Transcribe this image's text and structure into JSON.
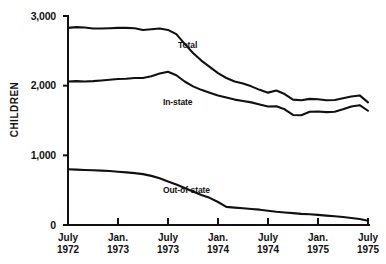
{
  "chart_data": {
    "type": "line",
    "title": "",
    "xlabel": "",
    "ylabel": "CHILDREN",
    "ylim": [
      0,
      3000
    ],
    "yticks": [
      0,
      1000,
      2000,
      3000
    ],
    "ytick_labels": [
      "0",
      "1,000",
      "2,000",
      "3,000"
    ],
    "grid": false,
    "legend_position": "inline-annotations",
    "x_tick_labels": [
      {
        "month": "July",
        "year": "1972"
      },
      {
        "month": "Jan.",
        "year": "1973"
      },
      {
        "month": "July",
        "year": "1973"
      },
      {
        "month": "Jan.",
        "year": "1974"
      },
      {
        "month": "July",
        "year": "1974"
      },
      {
        "month": "Jan.",
        "year": "1975"
      },
      {
        "month": "July",
        "year": "1975"
      }
    ],
    "x": [
      "1972-07",
      "1972-08",
      "1972-09",
      "1972-10",
      "1972-11",
      "1972-12",
      "1973-01",
      "1973-02",
      "1973-03",
      "1973-04",
      "1973-05",
      "1973-06",
      "1973-07",
      "1973-08",
      "1973-09",
      "1973-10",
      "1973-11",
      "1973-12",
      "1974-01",
      "1974-02",
      "1974-03",
      "1974-04",
      "1974-05",
      "1974-06",
      "1974-07",
      "1974-08",
      "1974-09",
      "1974-10",
      "1974-11",
      "1974-12",
      "1975-01",
      "1975-02",
      "1975-03",
      "1975-04",
      "1975-05",
      "1975-06",
      "1975-07"
    ],
    "series": [
      {
        "name": "Total",
        "label": "Total",
        "values": [
          2830,
          2840,
          2835,
          2820,
          2820,
          2825,
          2830,
          2830,
          2825,
          2800,
          2810,
          2820,
          2800,
          2740,
          2600,
          2470,
          2360,
          2270,
          2180,
          2110,
          2060,
          2030,
          1990,
          1940,
          1900,
          1930,
          1880,
          1800,
          1790,
          1810,
          1805,
          1790,
          1795,
          1820,
          1845,
          1860,
          1760
        ]
      },
      {
        "name": "In-state",
        "label": "In-state",
        "values": [
          2060,
          2065,
          2060,
          2065,
          2075,
          2085,
          2095,
          2100,
          2110,
          2110,
          2135,
          2175,
          2200,
          2150,
          2060,
          1990,
          1940,
          1900,
          1860,
          1830,
          1800,
          1780,
          1760,
          1730,
          1700,
          1705,
          1660,
          1580,
          1575,
          1625,
          1630,
          1620,
          1625,
          1660,
          1700,
          1720,
          1640
        ]
      },
      {
        "name": "Out-of-state",
        "label": "Out-of-state",
        "values": [
          800,
          795,
          790,
          785,
          780,
          775,
          765,
          755,
          745,
          730,
          705,
          670,
          625,
          580,
          530,
          480,
          430,
          390,
          330,
          260,
          250,
          240,
          230,
          220,
          205,
          190,
          180,
          170,
          160,
          155,
          145,
          135,
          125,
          115,
          100,
          85,
          60
        ]
      }
    ]
  },
  "axis": {
    "y_label": "CHILDREN"
  }
}
